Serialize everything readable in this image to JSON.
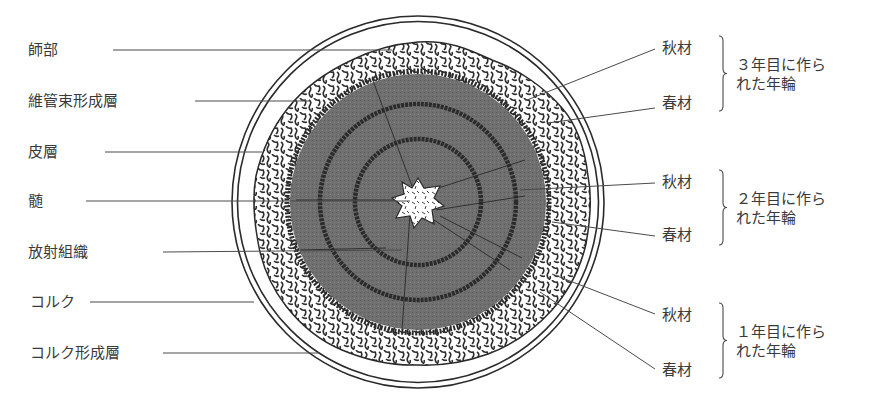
{
  "diagram": {
    "type": "stem-cross-section",
    "colors": {
      "line": "#3a3a3a",
      "xylem_fill": "#6e6e6e",
      "latewood_ring": "#2b2b2b",
      "background": "#ffffff",
      "phloem_texture": "#2e2e2e"
    }
  },
  "left_labels": [
    {
      "id": "phloem",
      "text": "師部",
      "x": 28,
      "y": 41,
      "line": [
        113,
        50,
        392,
        50
      ]
    },
    {
      "id": "vascular-cambium",
      "text": "維管束形成層",
      "x": 28,
      "y": 92,
      "line": [
        195,
        101,
        310,
        101
      ]
    },
    {
      "id": "cortex",
      "text": "皮層",
      "x": 28,
      "y": 143,
      "line": [
        105,
        152,
        262,
        152
      ]
    },
    {
      "id": "pith",
      "text": "髄",
      "x": 28,
      "y": 192,
      "line": [
        86,
        201,
        410,
        201
      ]
    },
    {
      "id": "ray-tissue",
      "text": "放射組織",
      "x": 28,
      "y": 243,
      "line": [
        163,
        252,
        402,
        250
      ]
    },
    {
      "id": "cork",
      "text": "コルク",
      "x": 30,
      "y": 293,
      "line": [
        90,
        302,
        254,
        302
      ]
    },
    {
      "id": "cork-cambium",
      "text": "コルク形成層",
      "x": 30,
      "y": 344,
      "line": [
        163,
        353,
        320,
        353
      ]
    }
  ],
  "right_labels": [
    {
      "id": "latewood-3",
      "text": "秋材",
      "x": 662,
      "y": 39,
      "line": [
        655,
        49,
        527,
        100
      ]
    },
    {
      "id": "earlywood-3",
      "text": "春材",
      "x": 662,
      "y": 94,
      "line": [
        655,
        108,
        548,
        123
      ]
    },
    {
      "id": "latewood-2",
      "text": "秋材",
      "x": 662,
      "y": 173,
      "line": [
        655,
        183,
        520,
        190
      ]
    },
    {
      "id": "earlywood-2",
      "text": "春材",
      "x": 662,
      "y": 226,
      "line": [
        655,
        236,
        552,
        222
      ]
    },
    {
      "id": "latewood-1",
      "text": "秋材",
      "x": 662,
      "y": 306,
      "line": [
        655,
        314,
        552,
        274
      ]
    },
    {
      "id": "earlywood-1",
      "text": "春材",
      "x": 662,
      "y": 361,
      "line": [
        655,
        369,
        540,
        292
      ]
    }
  ],
  "ring_groups": [
    {
      "id": "ring-year-3",
      "line1": "３年目に作ら",
      "line2": "れた年輪",
      "bracket_top": 36,
      "bracket_bottom": 111,
      "text_x": 736,
      "text_y": 56
    },
    {
      "id": "ring-year-2",
      "line1": "２年目に作ら",
      "line2": "れた年輪",
      "bracket_top": 170,
      "bracket_bottom": 245,
      "text_x": 736,
      "text_y": 190
    },
    {
      "id": "ring-year-1",
      "line1": "１年目に作ら",
      "line2": "れた年輪",
      "bracket_top": 303,
      "bracket_bottom": 378,
      "text_x": 736,
      "text_y": 323
    }
  ]
}
